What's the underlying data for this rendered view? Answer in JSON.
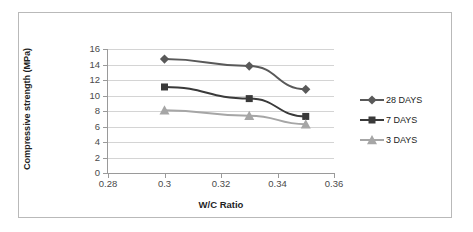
{
  "chart_data": {
    "type": "line",
    "title": "",
    "xlabel": "W/C Ratio",
    "ylabel": "Compressive strength (MPa)",
    "x": [
      0.3,
      0.33,
      0.35
    ],
    "xlim": [
      0.28,
      0.36
    ],
    "ylim": [
      0,
      16
    ],
    "xticks": [
      "0.28",
      "0.3",
      "0.32",
      "0.34",
      "0.36"
    ],
    "xtick_values": [
      0.28,
      0.3,
      0.32,
      0.34,
      0.36
    ],
    "yticks": [
      "0",
      "2",
      "4",
      "6",
      "8",
      "10",
      "12",
      "14",
      "16"
    ],
    "ytick_values": [
      0,
      2,
      4,
      6,
      8,
      10,
      12,
      14,
      16
    ],
    "grid": "horizontal",
    "legend_position": "right",
    "series": [
      {
        "name": "28 DAYS",
        "values": [
          14.7,
          13.8,
          10.8
        ],
        "marker": "diamond",
        "color": "#595959"
      },
      {
        "name": "7 DAYS",
        "values": [
          11.1,
          9.6,
          7.3
        ],
        "marker": "square",
        "color": "#3a3a3a"
      },
      {
        "name": "3 DAYS",
        "values": [
          8.1,
          7.4,
          6.3
        ],
        "marker": "triangle",
        "color": "#a6a6a6"
      }
    ]
  },
  "colors": {
    "grid": "#d4d4d4",
    "axis": "#9a9a9a",
    "frame": "#b9b9b9",
    "text": "#1f1f1f",
    "tick_text": "#4a4a4a",
    "background": "#ffffff"
  }
}
